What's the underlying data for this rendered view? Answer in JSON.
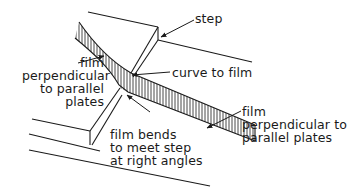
{
  "diagram": {
    "type": "schematic",
    "colors": {
      "ink": "#1a1a1a",
      "background": "#ffffff"
    },
    "labels": {
      "step": "step",
      "film_left": "film\nperpendicular\nto parallel\nplates",
      "curve": "curve to film",
      "film_bends": "film bends\nto meet step\nat right angles",
      "film_right": "film\nperpendicular to\nparallel plates"
    }
  }
}
